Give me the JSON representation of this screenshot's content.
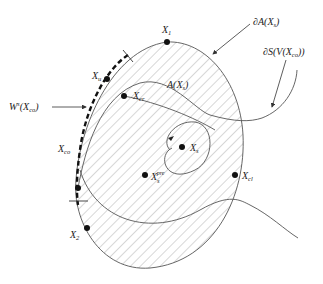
{
  "diagram": {
    "type": "region-of-attraction",
    "colors": {
      "line": "#555555",
      "hatch": "#9a9a9a",
      "point": "#111111",
      "text": "#222222"
    },
    "labels": {
      "boundary_A": {
        "main": "∂A(X",
        "sub": "s",
        "tail": ")"
      },
      "boundary_S": {
        "main": "∂S(V(X",
        "sub": "co",
        "tail": "))"
      },
      "region_A": {
        "main": "A(X",
        "sub": "s",
        "tail": ")"
      },
      "stable_manifold": {
        "main": "W",
        "sup": "s",
        "mid": "(X",
        "sub": "co",
        "tail": ")"
      }
    },
    "points": [
      {
        "id": "X1",
        "main": "X",
        "sub": "1"
      },
      {
        "id": "Xu",
        "main": "X",
        "sub": "u"
      },
      {
        "id": "Xcr",
        "main": "X",
        "sub": "cr"
      },
      {
        "id": "Xco",
        "main": "X",
        "sub": "co"
      },
      {
        "id": "X2",
        "main": "X",
        "sub": "2"
      },
      {
        "id": "Xs",
        "main": "X",
        "sub": "s"
      },
      {
        "id": "Xs_pre",
        "main": "X",
        "sub": "s",
        "sup": "pre"
      },
      {
        "id": "Xcl",
        "main": "X",
        "sub": "cl"
      }
    ]
  }
}
